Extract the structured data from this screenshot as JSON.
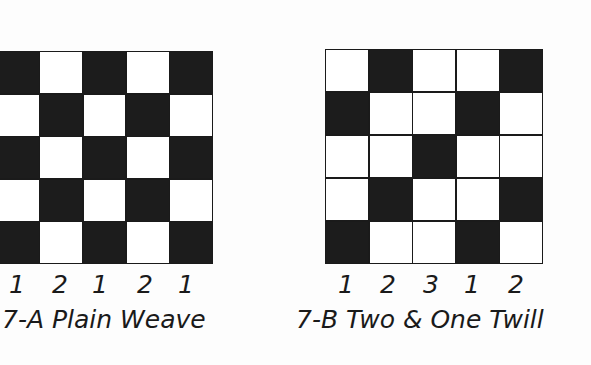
{
  "figures": [
    {
      "id": "7-A",
      "caption": "7-A Plain Weave",
      "column_labels": [
        "1",
        "2",
        "1",
        "2",
        "1"
      ],
      "pattern": [
        [
          1,
          0,
          1,
          0,
          1
        ],
        [
          0,
          1,
          0,
          1,
          0
        ],
        [
          1,
          0,
          1,
          0,
          1
        ],
        [
          0,
          1,
          0,
          1,
          0
        ],
        [
          1,
          0,
          1,
          0,
          1
        ]
      ]
    },
    {
      "id": "7-B",
      "caption": "7-B Two & One Twill",
      "column_labels": [
        "1",
        "2",
        "3",
        "1",
        "2"
      ],
      "pattern": [
        [
          0,
          1,
          0,
          0,
          1
        ],
        [
          1,
          0,
          0,
          1,
          0
        ],
        [
          0,
          0,
          1,
          0,
          0
        ],
        [
          0,
          1,
          0,
          0,
          1
        ],
        [
          1,
          0,
          0,
          1,
          0
        ]
      ]
    }
  ],
  "colors": {
    "filled": "#1c1c1c",
    "empty": "#ffffff",
    "line": "#1a1a1a"
  }
}
